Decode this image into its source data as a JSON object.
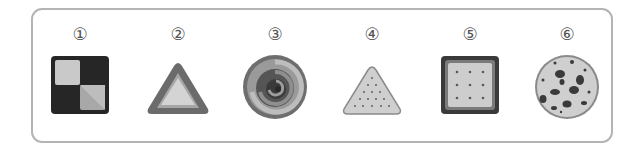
{
  "figure": {
    "items": [
      {
        "number": "①",
        "shape": "square",
        "description": "checkered square with dark border, light and dark quadrants"
      },
      {
        "number": "②",
        "shape": "triangle",
        "description": "triangle with dark rim and light center"
      },
      {
        "number": "③",
        "shape": "circle",
        "description": "swirl (spiral) round candy"
      },
      {
        "number": "④",
        "shape": "triangle",
        "description": "triangular cracker with dot holes"
      },
      {
        "number": "⑤",
        "shape": "square",
        "description": "square cracker with dark border and 9 dot holes"
      },
      {
        "number": "⑥",
        "shape": "circle",
        "description": "round cookie with chocolate chips"
      }
    ]
  },
  "colors": {
    "frame_border": "#b4b4b4",
    "dark": "#2b2b2b",
    "mid": "#7a7a7a",
    "light": "#cfcfcf"
  }
}
